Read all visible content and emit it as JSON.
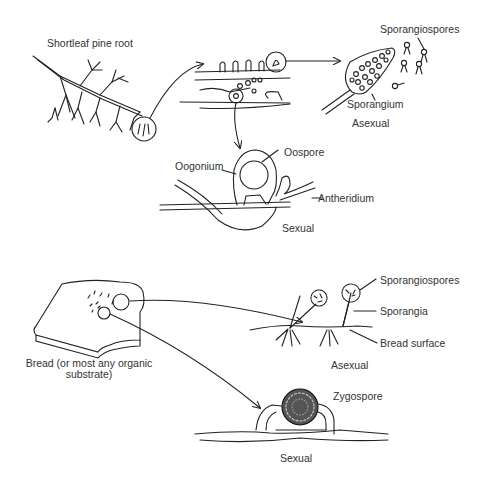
{
  "top_panel": {
    "root_label": "Shortleaf pine root",
    "asexual": {
      "sporangiospores_label": "Sporangiospores",
      "sporangium_label": "Sporangium",
      "mode_label": "Asexual"
    },
    "sexual": {
      "oogonium_label": "Oogonium",
      "oospore_label": "Oospore",
      "antheridium_label": "Antheridium",
      "mode_label": "Sexual"
    }
  },
  "bottom_panel": {
    "substrate_label_line1": "Bread (or most any organic",
    "substrate_label_line2": "substrate)",
    "asexual": {
      "sporangiospores_label": "Sporangiospores",
      "sporangia_label": "Sporangia",
      "bread_surface_label": "Bread surface",
      "mode_label": "Asexual"
    },
    "sexual": {
      "zygospore_label": "Zygospore",
      "mode_label": "Sexual"
    }
  },
  "colors": {
    "line": "#222222",
    "text": "#333333",
    "background": "#ffffff"
  }
}
